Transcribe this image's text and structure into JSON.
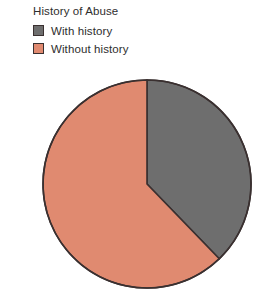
{
  "chart_data": {
    "type": "pie",
    "title": "History of Abuse",
    "xlabel": "",
    "ylabel": "",
    "legend_position": "top-left",
    "grid": false,
    "categories": [
      "With history",
      "Without history"
    ],
    "values": [
      38,
      62
    ],
    "colors": [
      "#6e6e6e",
      "#e08a70"
    ],
    "start_angle_deg": 0,
    "direction": "clockwise",
    "slices": [
      {
        "label": "With history",
        "value": 38,
        "color": "#6e6e6e",
        "sweep_deg": 136
      },
      {
        "label": "Without history",
        "value": 62,
        "color": "#e08a70",
        "sweep_deg": 224
      }
    ]
  },
  "legend": {
    "title": "History of Abuse",
    "items": [
      {
        "label": "With history",
        "color": "#6e6e6e",
        "swatch_icon": "square-swatch-icon"
      },
      {
        "label": "Without history",
        "color": "#e08a70",
        "swatch_icon": "square-swatch-icon"
      }
    ]
  },
  "pie": {
    "outline_color": "#3a3030",
    "center_x": 147,
    "center_y": 184,
    "radius": 104
  }
}
